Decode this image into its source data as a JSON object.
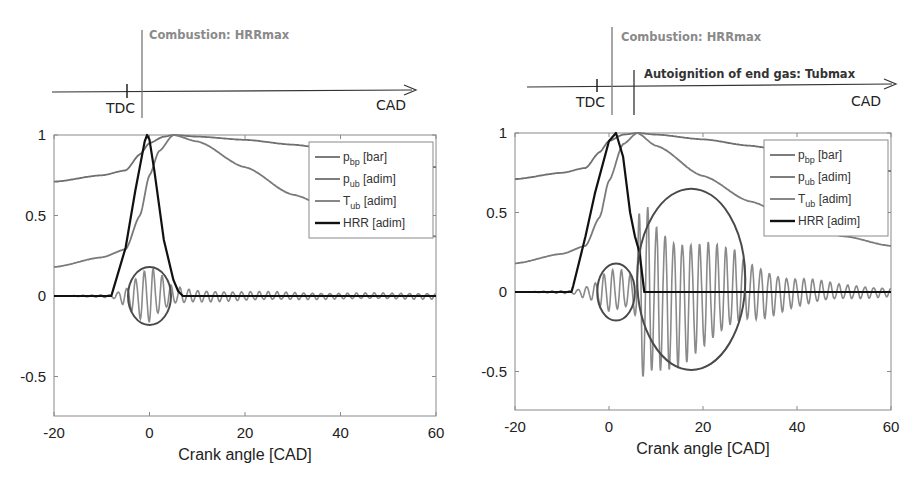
{
  "colors": {
    "frame": "#8a8a8a",
    "p_bp": "#6e6e6e",
    "p_ub": "#707070",
    "T_ub": "#7a7a7a",
    "HRR": "#111111",
    "ellipse": "#4a4a4a",
    "combustion_label": "#8a8a8a",
    "autoignition_label": "#333333"
  },
  "timelines": [
    {
      "tdc_label": "TDC",
      "axis_label": "CAD",
      "events": [
        {
          "label": "Combustion: HRRmax"
        }
      ]
    },
    {
      "tdc_label": "TDC",
      "axis_label": "CAD",
      "events": [
        {
          "label": "Combustion: HRRmax"
        },
        {
          "label": "Autoignition of end gas: Tubmax"
        }
      ]
    }
  ],
  "chart_data": [
    {
      "type": "line",
      "title": "",
      "xlabel": "Crank angle [CAD]",
      "ylabel": "",
      "xlim": [
        -20,
        60
      ],
      "ylim": [
        -0.75,
        1
      ],
      "xticks": [
        "-20",
        "0",
        "20",
        "40",
        "60"
      ],
      "yticks": [
        "-0.5",
        "0",
        "0.5",
        "1"
      ],
      "grid": false,
      "legend_position": "upper right",
      "legend": [
        {
          "name": "p",
          "sub": "bp",
          "unit": " [bar]"
        },
        {
          "name": "p",
          "sub": "ub",
          "unit": " [adim]"
        },
        {
          "name": "T",
          "sub": "ub",
          "unit": " [adim]"
        },
        {
          "name": "HRR",
          "sub": "",
          "unit": " [adim]"
        }
      ],
      "series": [
        {
          "name": "p_bp [bar]",
          "note": "oscillating pressure signal; band-pass, amplitude ~0.2 near 0 CAD, decaying after",
          "x": [
            -20,
            -8,
            -5,
            -2,
            0,
            2,
            5,
            10,
            20,
            40,
            60
          ],
          "amplitude": [
            0.0,
            0.01,
            0.06,
            0.16,
            0.2,
            0.14,
            0.06,
            0.04,
            0.03,
            0.02,
            0.02
          ]
        },
        {
          "name": "p_ub [adim]",
          "x": [
            -20,
            -10,
            -5,
            -2,
            0,
            3,
            5,
            10,
            20,
            30,
            40,
            50,
            60
          ],
          "values": [
            0.71,
            0.75,
            0.78,
            0.88,
            0.95,
            0.99,
            1.0,
            0.99,
            0.97,
            0.94,
            0.9,
            0.86,
            0.8
          ]
        },
        {
          "name": "T_ub [adim]",
          "x": [
            -20,
            -10,
            -5,
            -2,
            0,
            2,
            5,
            10,
            20,
            30,
            40,
            50,
            60
          ],
          "values": [
            0.18,
            0.24,
            0.29,
            0.5,
            0.75,
            0.9,
            1.0,
            0.96,
            0.8,
            0.63,
            0.51,
            0.43,
            0.37
          ]
        },
        {
          "name": "HRR [adim]",
          "x": [
            -20,
            -8,
            -7.6,
            -5,
            -3,
            -1,
            -0.5,
            0,
            1,
            3,
            5,
            6,
            7,
            60
          ],
          "values": [
            0.0,
            0.0,
            0.04,
            0.3,
            0.65,
            0.96,
            1.0,
            0.97,
            0.78,
            0.35,
            0.1,
            0.03,
            0.0,
            0.0
          ]
        }
      ],
      "annotations": [
        {
          "type": "ellipse",
          "cx": 0,
          "cy": 0,
          "rx_cad": 4.5,
          "ry": 0.18,
          "note": "circled oscillation at combustion"
        }
      ]
    },
    {
      "type": "line",
      "title": "",
      "xlabel": "Crank angle [CAD]",
      "ylabel": "",
      "xlim": [
        -20,
        60
      ],
      "ylim": [
        -0.75,
        1
      ],
      "xticks": [
        "-20",
        "0",
        "20",
        "40",
        "60"
      ],
      "yticks": [
        "-0.5",
        "0",
        "0.5",
        "1"
      ],
      "grid": false,
      "legend_position": "upper right",
      "legend": [
        {
          "name": "p",
          "sub": "bp",
          "unit": " [bar]"
        },
        {
          "name": "p",
          "sub": "ub",
          "unit": " [adim]"
        },
        {
          "name": "T",
          "sub": "ub",
          "unit": " [adim]"
        },
        {
          "name": "HRR",
          "sub": "",
          "unit": " [adim]"
        }
      ],
      "series": [
        {
          "name": "p_bp [bar]",
          "note": "knock oscillation; small ~0.15 around 0-4 CAD, large spike ~0.67/-0.6 at ~7 CAD decaying to ~0.03 at 60",
          "x": [
            -20,
            -8,
            -4,
            0,
            3,
            5,
            7,
            10,
            15,
            20,
            25,
            30,
            40,
            50,
            60
          ],
          "amplitude": [
            0.0,
            0.01,
            0.05,
            0.15,
            0.14,
            0.1,
            0.67,
            0.52,
            0.45,
            0.38,
            0.3,
            0.2,
            0.1,
            0.05,
            0.03
          ]
        },
        {
          "name": "p_ub [adim]",
          "x": [
            -20,
            -10,
            -5,
            -2,
            0,
            3,
            6,
            10,
            20,
            30,
            40,
            50,
            60
          ],
          "values": [
            0.71,
            0.75,
            0.78,
            0.88,
            0.95,
            0.99,
            1.0,
            0.99,
            0.96,
            0.92,
            0.87,
            0.82,
            0.76
          ]
        },
        {
          "name": "T_ub [adim]",
          "x": [
            -20,
            -10,
            -5,
            -2,
            0,
            3,
            6,
            10,
            20,
            30,
            40,
            50,
            60
          ],
          "values": [
            0.18,
            0.24,
            0.29,
            0.47,
            0.7,
            0.93,
            1.0,
            0.92,
            0.73,
            0.57,
            0.44,
            0.35,
            0.29
          ]
        },
        {
          "name": "HRR [adim]",
          "x": [
            -20,
            -8,
            -7.6,
            -5,
            -3,
            0,
            1.5,
            3,
            4.5,
            5.5,
            6.5,
            7.5,
            60
          ],
          "values": [
            0.0,
            0.0,
            0.04,
            0.35,
            0.62,
            0.95,
            1.0,
            0.85,
            0.5,
            0.35,
            0.25,
            0.0,
            0.0
          ]
        }
      ],
      "annotations": [
        {
          "type": "ellipse",
          "cx": 1.5,
          "cy": 0,
          "rx_cad": 4,
          "ry": 0.18,
          "note": "circled oscillation at combustion"
        },
        {
          "type": "ellipse",
          "cx": 17.5,
          "cy": 0.08,
          "rx_cad": 11.5,
          "ry": 0.57,
          "note": "circled knock oscillation after autoignition"
        }
      ]
    }
  ]
}
